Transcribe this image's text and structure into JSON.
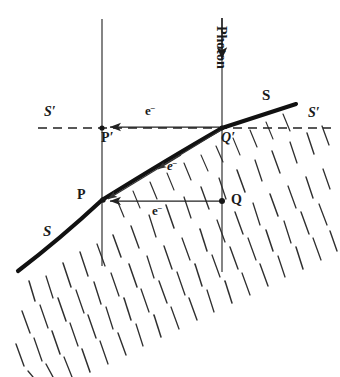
{
  "figure": {
    "labels": {
      "point_P": "P",
      "point_Q": "Q",
      "point_P_prime": "P",
      "point_P_prime_mark": "′",
      "point_Q_prime": "Q",
      "point_Q_prime_mark": "′",
      "surface_upper_right": "S",
      "surface_lower_left": "S",
      "plane_left": "S",
      "plane_left_mark": "′",
      "plane_right": "S",
      "plane_right_mark": "′",
      "electron_top": "e",
      "electron_top_charge": "–",
      "electron_diagonal": "e",
      "electron_diagonal_charge": "–",
      "electron_bottom": "e",
      "electron_bottom_charge": "–",
      "photon": "Photon"
    },
    "colors": {
      "ink": "#1a1a1a",
      "surface_line": "#111111",
      "hatch": "#333333",
      "thin_line": "#2b2b2b",
      "dashed_line": "#222222",
      "background": "#ffffff"
    },
    "geometry": {
      "surface_curve": "M 18 271 Q 78 222 102 200 Q 170 158 222 128 L 296 104",
      "reference_plane_y": 128,
      "vertical_line_left_x": 102,
      "vertical_line_right_x": 222,
      "point_P": [
        102,
        200
      ],
      "point_Q": [
        222,
        201
      ],
      "point_P_prime": [
        102,
        128
      ],
      "point_Q_prime": [
        222,
        128
      ],
      "photon_line_top": 18,
      "photon_arrow_tip": 60,
      "dashed_line_start_x": 38,
      "dashed_line_end_x": 331
    }
  }
}
